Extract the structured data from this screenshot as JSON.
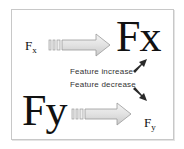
{
  "diagram": {
    "top_row": {
      "source_label": "F",
      "source_subscript": "x",
      "target_label": "Fx",
      "arrow": {
        "direction": "right",
        "style": "striped-tail-gradient"
      }
    },
    "bottom_row": {
      "source_label": "Fy",
      "target_label": "F",
      "target_subscript": "y",
      "arrow": {
        "direction": "right",
        "style": "striped-tail-gradient"
      }
    },
    "legend": {
      "increase_label": "Feature increase",
      "decrease_label": "Feature decrease",
      "increase_icon": "arrow-up-right-icon",
      "decrease_icon": "arrow-down-right-icon"
    },
    "colors": {
      "border": "#c8c8c8",
      "text": "#111111",
      "arrow_fill_light": "#f0f0f0",
      "arrow_fill_dark": "#cfcfcf",
      "arrow_outline": "#9a9a9a",
      "legend_arrow": "#2a2a2a"
    }
  }
}
